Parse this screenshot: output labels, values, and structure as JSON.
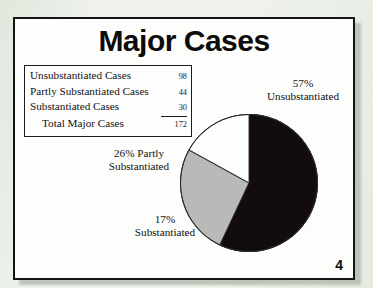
{
  "slide": {
    "title": "Major Cases",
    "page_number": "4",
    "frame_color": "#141414",
    "background_color": "#fdfdfb"
  },
  "summary_table": {
    "rows": [
      {
        "label": "Unsubstantiated Cases",
        "value": "98",
        "indent": false,
        "ruled": false
      },
      {
        "label": "Partly Substantiated Cases",
        "value": "44",
        "indent": false,
        "ruled": false
      },
      {
        "label": "Substantiated Cases",
        "value": "30",
        "indent": false,
        "ruled": true
      },
      {
        "label": "Total Major Cases",
        "value": "172",
        "indent": true,
        "ruled": false
      }
    ]
  },
  "labels": {
    "unsubstantiated_pct": "57%",
    "unsubstantiated_name": "Unsubstantiated",
    "partly_line1": "26% Partly",
    "partly_line2": "Substantiated",
    "substantiated_pct": "17%",
    "substantiated_name": "Substantiated"
  },
  "chart_data": {
    "type": "pie",
    "title": "Major Cases",
    "categories": [
      "Unsubstantiated",
      "Partly Substantiated",
      "Substantiated"
    ],
    "values": [
      98,
      44,
      30
    ],
    "percentages": [
      57,
      26,
      17
    ],
    "total": 172,
    "total_label": "Total Major Cases",
    "colors": [
      "#120d0c",
      "#b9b9b9",
      "#fdfdfb"
    ],
    "slice_colors_named": [
      "black",
      "gray",
      "white"
    ],
    "start_angle_deg": 0,
    "direction": "clockwise",
    "legend": "none",
    "data_labels": [
      "57% Unsubstantiated",
      "26% Partly Substantiated",
      "17% Substantiated"
    ],
    "xlabel": "",
    "ylabel": ""
  }
}
